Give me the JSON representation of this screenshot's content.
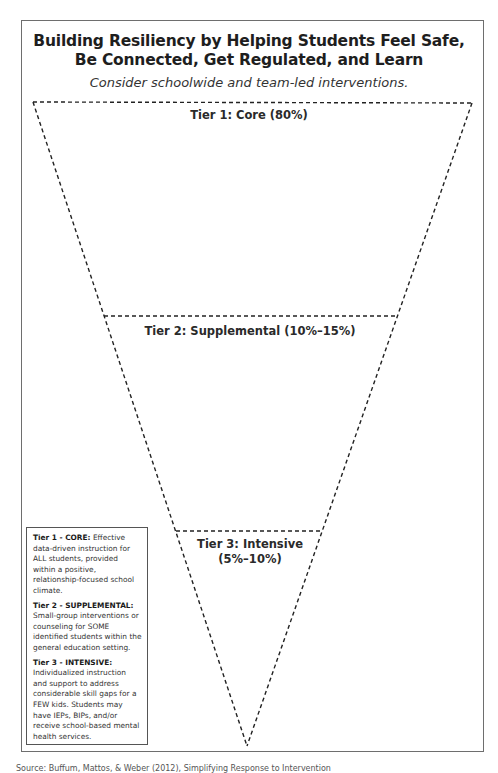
{
  "title": {
    "line1": "Building Resiliency by Helping Students Feel Safe,",
    "line2": "Be Connected, Get Regulated, and Learn"
  },
  "subtitle": "Consider schoolwide and team-led interventions.",
  "pyramid": {
    "orientation": "inverted",
    "tiers": [
      {
        "label": "Tier 1: Core (80%)"
      },
      {
        "label": "Tier 2: Supplemental (10%–15%)"
      },
      {
        "label_line1": "Tier 3: Intensive",
        "label_line2": "(5%–10%)"
      }
    ]
  },
  "legend": {
    "tier1": {
      "heading": "Tier 1 - CORE:",
      "text": " Effective data-driven instruction for ALL students, provided within a positive, relationship-focused school climate."
    },
    "tier2": {
      "heading": "Tier 2 - SUPPLEMENTAL:",
      "text": " Small-group interventions or counseling for SOME identified students within the general education setting."
    },
    "tier3": {
      "heading": "Tier 3 - INTENSIVE:",
      "text": " Individualized instruction and support to address considerable skill gaps for a FEW kids. Students may have IEPs, BIPs, and/or receive school-based mental health services."
    }
  },
  "footer": {
    "source": "Source: Buffum, Mattos, & Weber (2012), Simplifying Response to Intervention"
  },
  "colors": {
    "frame": "#6e6e6e",
    "dashes": "#222222",
    "text": "#1f1f1f"
  }
}
